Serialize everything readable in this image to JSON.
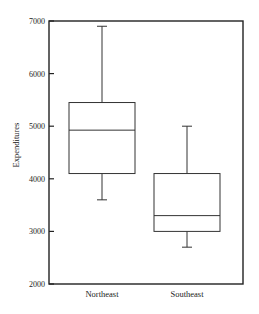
{
  "chart_data": {
    "type": "boxplot",
    "title": "",
    "xlabel": "",
    "ylabel": "Expenditures",
    "ylim": [
      2000,
      7000
    ],
    "yticks": [
      2000,
      3000,
      4000,
      5000,
      6000,
      7000
    ],
    "ytick_labels": [
      "2000",
      "3000",
      "4000",
      "5000",
      "6000",
      "7000"
    ],
    "grid": false,
    "legend": null,
    "categories": [
      "Northeast",
      "Southeast"
    ],
    "series": [
      {
        "name": "Northeast",
        "whisker_low": 3600,
        "q1": 4100,
        "median": 4925,
        "q3": 5450,
        "whisker_high": 6900
      },
      {
        "name": "Southeast",
        "whisker_low": 2700,
        "q1": 3000,
        "median": 3300,
        "q3": 4100,
        "whisker_high": 5000
      }
    ]
  },
  "style": {
    "line_color": "#333333",
    "frame_color": "#222222",
    "background": "#ffffff"
  }
}
